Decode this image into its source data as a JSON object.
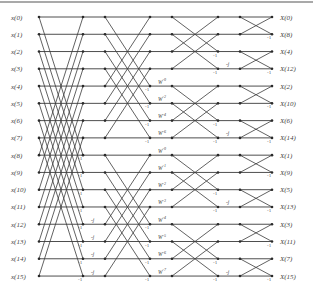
{
  "diagram": {
    "inputs": [
      "x(0)",
      "x(1)",
      "x(2)",
      "x(3)",
      "x(4)",
      "x(5)",
      "x(6)",
      "x(7)",
      "x(8)",
      "x(9)",
      "x(10)",
      "x(11)",
      "x(12)",
      "x(13)",
      "x(14)",
      "x(15)"
    ],
    "outputs": [
      "X(0)",
      "X(8)",
      "X(4)",
      "X(12)",
      "X(2)",
      "X(10)",
      "X(6)",
      "X(14)",
      "X(1)",
      "X(9)",
      "X(5)",
      "X(13)",
      "X(3)",
      "X(11)",
      "X(7)",
      "X(15)"
    ],
    "stages": [
      {
        "name": "stage-1",
        "span": 8,
        "twiddles": []
      },
      {
        "name": "stage-2",
        "span": 4,
        "twiddles": [
          {
            "row": 12,
            "label": "-j"
          },
          {
            "row": 13,
            "label": "-j"
          },
          {
            "row": 14,
            "label": "-j"
          },
          {
            "row": 15,
            "label": "-j"
          }
        ]
      },
      {
        "name": "stage-3",
        "span": 2,
        "twiddles": [
          {
            "row": 4,
            "label": "W^0"
          },
          {
            "row": 5,
            "label": "W^2"
          },
          {
            "row": 6,
            "label": "W^4"
          },
          {
            "row": 7,
            "label": "W^6"
          },
          {
            "row": 8,
            "label": "W^0"
          },
          {
            "row": 9,
            "label": "W^1"
          },
          {
            "row": 10,
            "label": "W^2"
          },
          {
            "row": 11,
            "label": "W^3"
          },
          {
            "row": 12,
            "label": "W^4"
          },
          {
            "row": 13,
            "label": "W^5"
          },
          {
            "row": 14,
            "label": "W^6"
          },
          {
            "row": 15,
            "label": "W^7"
          }
        ]
      },
      {
        "name": "stage-4",
        "span": 1,
        "twiddles": [
          {
            "row": 3,
            "label": "-j"
          },
          {
            "row": 7,
            "label": "-j"
          },
          {
            "row": 11,
            "label": "-j"
          },
          {
            "row": 15,
            "label": "-j"
          }
        ]
      }
    ],
    "negation_marker": "-1",
    "colors": {
      "line": "#3a3a3a",
      "text": "#444444",
      "background": "#ffffff"
    }
  }
}
